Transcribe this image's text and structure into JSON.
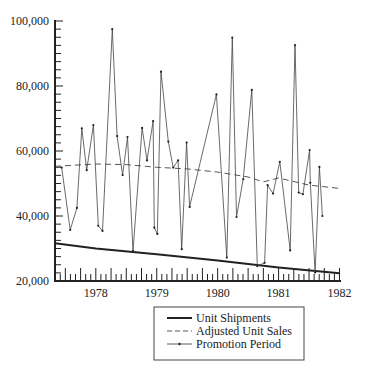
{
  "chart_data": {
    "type": "line",
    "title": "",
    "xlabel": "",
    "ylabel": "",
    "ylim": [
      20000,
      100000
    ],
    "xlim": [
      1977.33,
      1982.0
    ],
    "yticks": [
      {
        "value": 20000,
        "label": "20,000"
      },
      {
        "value": 40000,
        "label": "40,000"
      },
      {
        "value": 60000,
        "label": "60,000"
      },
      {
        "value": 80000,
        "label": "80,000"
      },
      {
        "value": 100000,
        "label": "100,000"
      }
    ],
    "y_minor_step": 2500,
    "xticks": [
      {
        "value": 1978,
        "label": "1978"
      },
      {
        "value": 1979,
        "label": "1979"
      },
      {
        "value": 1980,
        "label": "1980"
      },
      {
        "value": 1981,
        "label": "1981"
      },
      {
        "value": 1982,
        "label": "1982"
      }
    ],
    "x_minor": "monthly ticks, taller every quarter",
    "legend": {
      "position": "below-right",
      "entries": [
        {
          "label": "Unit Shipments",
          "style": "solid-thick"
        },
        {
          "label": "Adjusted Unit Sales",
          "style": "dashed"
        },
        {
          "label": "Promotion Period",
          "style": "thin-with-markers"
        }
      ]
    },
    "series": [
      {
        "name": "Unit Shipments",
        "x": [
          1977.33,
          1978.0,
          1979.0,
          1980.0,
          1981.0,
          1982.0
        ],
        "values": [
          31600,
          30000,
          28200,
          26300,
          24200,
          22400
        ]
      },
      {
        "name": "Adjusted Unit Sales",
        "x": [
          1977.33,
          1978.0,
          1978.5,
          1979.0,
          1979.5,
          1980.0,
          1980.5,
          1980.75,
          1981.0,
          1981.5,
          1982.0
        ],
        "values": [
          55300,
          56000,
          55800,
          55000,
          54500,
          53500,
          52000,
          50500,
          51700,
          49500,
          48500
        ]
      },
      {
        "name": "Promotion Period",
        "x": [
          1977.44,
          1977.58,
          1977.69,
          1977.77,
          1977.85,
          1977.96,
          1978.04,
          1978.11,
          1978.27,
          1978.35,
          1978.44,
          1978.52,
          1978.61,
          1978.76,
          1978.84,
          1978.94,
          1978.96,
          1979.01,
          1979.07,
          1979.19,
          1979.27,
          1979.35,
          1979.41,
          1979.49,
          1979.54,
          1979.98,
          1980.15,
          1980.24,
          1980.31,
          1980.42,
          1980.56,
          1980.65,
          1980.77,
          1980.82,
          1980.91,
          1981.02,
          1981.19,
          1981.27,
          1981.33,
          1981.4,
          1981.51,
          1981.52,
          1981.6,
          1981.67,
          1981.72
        ],
        "values": [
          54900,
          35700,
          42500,
          67000,
          54100,
          68000,
          37000,
          35400,
          97500,
          64600,
          52600,
          64300,
          29200,
          67100,
          57100,
          69200,
          36400,
          34500,
          84400,
          62900,
          54900,
          57100,
          29800,
          62600,
          42800,
          77400,
          27200,
          94900,
          39700,
          51300,
          78800,
          24600,
          25600,
          49500,
          46900,
          56700,
          29400,
          92600,
          47200,
          46700,
          60300,
          50200,
          22600,
          55100,
          40000
        ]
      }
    ]
  },
  "legend_labels": {
    "unit_shipments": "Unit Shipments",
    "adjusted_unit_sales": "Adjusted Unit Sales",
    "promotion_period": "Promotion Period"
  },
  "colors": {
    "axis": "#222222",
    "series": "#333333",
    "dashed": "#555555",
    "background": "#ffffff"
  }
}
